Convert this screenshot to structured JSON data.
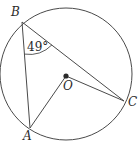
{
  "figure": {
    "kind": "circle-geometry-diagram",
    "background_color": "#ffffff",
    "stroke_color": "#4a4a4a",
    "text_color": "#2b2b2b",
    "circle": {
      "center_x": 66,
      "center_y": 74,
      "radius": 66
    },
    "points": {
      "B": {
        "label": "B",
        "x": 22,
        "y": 22
      },
      "A": {
        "label": "A",
        "x": 30,
        "y": 128
      },
      "C": {
        "label": "C",
        "x": 124,
        "y": 101
      },
      "O": {
        "label": "O",
        "x": 66,
        "y": 76
      }
    },
    "segments": [
      {
        "name": "chord-BA",
        "from": "B",
        "to": "A"
      },
      {
        "name": "chord-BC",
        "from": "B",
        "to": "C"
      },
      {
        "name": "radius-OA",
        "from": "O",
        "to": "A"
      },
      {
        "name": "radius-OC",
        "from": "O",
        "to": "C"
      }
    ],
    "angles": [
      {
        "name": "angle-ABC",
        "vertex": "B",
        "label": "49°",
        "value": 49,
        "unit": "degrees"
      }
    ]
  }
}
